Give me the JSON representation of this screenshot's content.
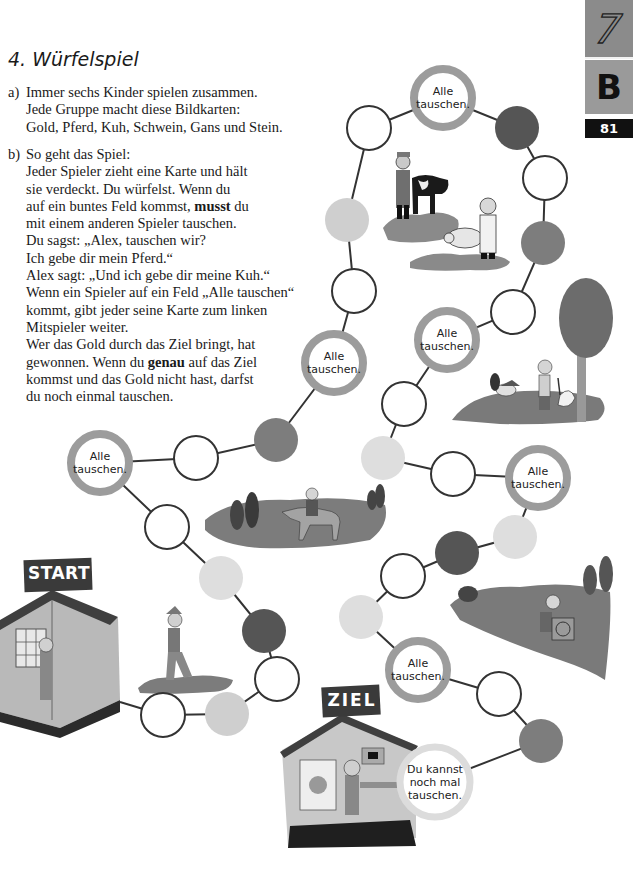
{
  "header": {
    "title": "4.  Würfelspiel",
    "chapter_tab": "7",
    "section_tab": "B",
    "page_number": "81"
  },
  "task_a": {
    "label": "a)",
    "lines": [
      "Immer sechs Kinder spielen zusammen.",
      "Jede Gruppe macht diese Bildkarten:",
      "Gold, Pferd, Kuh, Schwein, Gans und Stein."
    ]
  },
  "task_b": {
    "label": "b)",
    "line1": "So geht das Spiel:",
    "line2": "Jeder Spieler zieht eine Karte und hält",
    "line3": "sie verdeckt. Du würfelst. Wenn du",
    "line4_pre": "auf ein buntes Feld kommst, ",
    "line4_bold": "musst",
    "line4_post": " du",
    "line5": "mit einem anderen Spieler tauschen.",
    "line6": "Du sagst: „Alex, tauschen wir?",
    "line7": "Ich gebe dir mein Pferd.“",
    "line8": "Alex sagt: „Und ich gebe dir meine Kuh.“",
    "line9": "Wenn ein Spieler auf ein Feld „Alle tauschen“",
    "line10": "kommt, gibt jeder seine Karte zum linken",
    "line11": "Mitspieler weiter.",
    "line12": "Wer das Gold durch das Ziel bringt, hat",
    "line13_pre": "gewonnen. Wenn du ",
    "line13_bold": "genau",
    "line13_post": " auf das Ziel",
    "line14": "kommst und das Gold nicht hast, darfst",
    "line15": "du noch einmal tauschen."
  },
  "board": {
    "start_label": "START",
    "goal_label": "ZIEL",
    "alle_tauschen_line1": "Alle",
    "alle_tauschen_line2": "tauschen.",
    "goal_bubble_line1": "Du kannst",
    "goal_bubble_line2": "noch mal",
    "goal_bubble_line3": "tauschen.",
    "colors": {
      "ring": "#9c9c9c",
      "dark": "#555555",
      "mid": "#7d7d7d",
      "light": "#cfcfcf",
      "lighter": "#dedede",
      "line": "#333333"
    },
    "fields": [
      {
        "type": "white",
        "x": 163,
        "y": 715
      },
      {
        "type": "light",
        "x": 227,
        "y": 714
      },
      {
        "type": "white",
        "x": 277,
        "y": 679
      },
      {
        "type": "dark",
        "x": 264,
        "y": 631
      },
      {
        "type": "lighter",
        "x": 221,
        "y": 578
      },
      {
        "type": "white",
        "x": 167,
        "y": 527
      },
      {
        "type": "alle",
        "x": 100,
        "y": 463
      },
      {
        "type": "white",
        "x": 196,
        "y": 458
      },
      {
        "type": "mid",
        "x": 276,
        "y": 440
      },
      {
        "type": "alle",
        "x": 334,
        "y": 363
      },
      {
        "type": "white",
        "x": 354,
        "y": 291
      },
      {
        "type": "light",
        "x": 347,
        "y": 220
      },
      {
        "type": "white",
        "x": 369,
        "y": 128
      },
      {
        "type": "alle",
        "x": 443,
        "y": 98
      },
      {
        "type": "dark",
        "x": 517,
        "y": 128
      },
      {
        "type": "white",
        "x": 545,
        "y": 178
      },
      {
        "type": "mid",
        "x": 543,
        "y": 243
      },
      {
        "type": "white",
        "x": 513,
        "y": 312
      },
      {
        "type": "alle",
        "x": 447,
        "y": 340
      },
      {
        "type": "white",
        "x": 404,
        "y": 404
      },
      {
        "type": "lighter",
        "x": 383,
        "y": 458
      },
      {
        "type": "white",
        "x": 453,
        "y": 474
      },
      {
        "type": "alle",
        "x": 538,
        "y": 478
      },
      {
        "type": "lighter",
        "x": 515,
        "y": 537
      },
      {
        "type": "dark",
        "x": 457,
        "y": 553
      },
      {
        "type": "white",
        "x": 403,
        "y": 576
      },
      {
        "type": "lighter",
        "x": 361,
        "y": 617
      },
      {
        "type": "alle",
        "x": 418,
        "y": 670
      },
      {
        "type": "white",
        "x": 499,
        "y": 694
      },
      {
        "type": "mid",
        "x": 541,
        "y": 741
      },
      {
        "type": "goal",
        "x": 435,
        "y": 782
      }
    ]
  },
  "illustrations": [
    "farmer-with-cow",
    "butcher-with-pig",
    "boy-with-goose-and-tree",
    "rider-on-horse",
    "man-with-stone-cart",
    "walking-man",
    "start-house",
    "goal-house"
  ]
}
